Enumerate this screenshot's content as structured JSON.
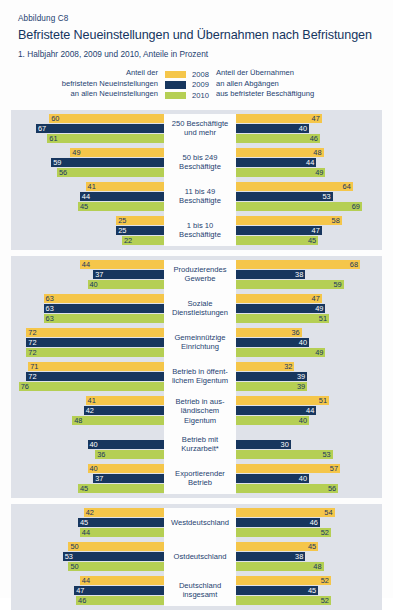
{
  "header": {
    "figure_label": "Abbildung C8",
    "title": "Befristete Neueinstellungen und Übernahmen nach Befristungen",
    "subtitle": "1. Halbjahr 2008, 2009 und 2010, Anteile in Prozent"
  },
  "legend": {
    "left_lines": [
      "Anteil der",
      "befristeten Neueinstellungen",
      "an allen Neueinstellungen"
    ],
    "right_lines": [
      "Anteil der Übernahmen",
      "an allen Abgängen",
      "aus befristeter Beschäftigung"
    ],
    "entries": [
      {
        "year": "2008",
        "color": "#f5c64a"
      },
      {
        "year": "2009",
        "color": "#17365e"
      },
      {
        "year": "2010",
        "color": "#b5cf54"
      }
    ]
  },
  "colors": {
    "series_2008": "#f5c64a",
    "series_2009": "#17365e",
    "series_2010": "#b5cf54",
    "panel_background": "#dfe2e9",
    "center_column": "#fdfdfd",
    "text": "#1d3f70"
  },
  "chart_data": {
    "type": "bar",
    "title": "Befristete Neueinstellungen und Übernahmen nach Befristungen",
    "subtitle": "1. Halbjahr 2008, 2009 und 2010, Anteile in Prozent",
    "orientation": "horizontal",
    "layout": "diverging-paired-panels",
    "xlabel": "",
    "ylabel": "",
    "xlim": [
      0,
      80
    ],
    "grid": false,
    "legend_position": "top",
    "series_names": [
      "2008",
      "2009",
      "2010"
    ],
    "left_metric": "Anteil der befristeten Neueinstellungen an allen Neueinstellungen",
    "right_metric": "Anteil der Übernahmen an allen Abgängen aus befristeter Beschäftigung",
    "panels": [
      {
        "name": "Betriebsgröße",
        "groups": [
          {
            "label_lines": [
              "250 Beschäftigte",
              "und mehr"
            ],
            "left": [
              60,
              67,
              61
            ],
            "right": [
              47,
              40,
              46
            ]
          },
          {
            "label_lines": [
              "50 bis 249",
              "Beschäftigte"
            ],
            "left": [
              49,
              59,
              56
            ],
            "right": [
              48,
              44,
              49
            ]
          },
          {
            "label_lines": [
              "11 bis 49",
              "Beschäftigte"
            ],
            "left": [
              41,
              44,
              45
            ],
            "right": [
              64,
              53,
              69
            ]
          },
          {
            "label_lines": [
              "1 bis 10",
              "Beschäftigte"
            ],
            "left": [
              25,
              25,
              22
            ],
            "right": [
              58,
              47,
              45
            ]
          }
        ]
      },
      {
        "name": "Branche und Betriebsmerkmale",
        "groups": [
          {
            "label_lines": [
              "Produzierendes",
              "Gewerbe"
            ],
            "left": [
              44,
              37,
              40
            ],
            "right": [
              68,
              38,
              59
            ]
          },
          {
            "label_lines": [
              "Soziale",
              "Dienstleistungen"
            ],
            "left": [
              63,
              63,
              63
            ],
            "right": [
              47,
              49,
              51
            ]
          },
          {
            "label_lines": [
              "Gemeinnützige",
              "Einrichtung"
            ],
            "left": [
              72,
              72,
              72
            ],
            "right": [
              36,
              40,
              49
            ]
          },
          {
            "label_lines": [
              "Betrieb in öffent-",
              "lichem Eigentum"
            ],
            "left": [
              71,
              72,
              76
            ],
            "right": [
              32,
              39,
              39
            ]
          },
          {
            "label_lines": [
              "Betrieb in aus-",
              "ländischem Eigentum"
            ],
            "left": [
              41,
              42,
              48
            ],
            "right": [
              51,
              44,
              40
            ]
          },
          {
            "label_lines": [
              "Betrieb mit",
              "Kurzarbeit*"
            ],
            "left": [
              null,
              40,
              36
            ],
            "right": [
              null,
              30,
              53
            ]
          },
          {
            "label_lines": [
              "Exportierender",
              "Betrieb"
            ],
            "left": [
              40,
              37,
              45
            ],
            "right": [
              57,
              40,
              56
            ]
          }
        ]
      },
      {
        "name": "Region",
        "groups": [
          {
            "label_lines": [
              "Westdeutschland"
            ],
            "left": [
              42,
              45,
              44
            ],
            "right": [
              54,
              46,
              52
            ]
          },
          {
            "label_lines": [
              "Ostdeutschland"
            ],
            "left": [
              50,
              53,
              50
            ],
            "right": [
              45,
              38,
              48
            ]
          },
          {
            "label_lines": [
              "Deutschland",
              "insgesamt"
            ],
            "left": [
              44,
              47,
              46
            ],
            "right": [
              52,
              45,
              52
            ]
          }
        ]
      }
    ]
  }
}
